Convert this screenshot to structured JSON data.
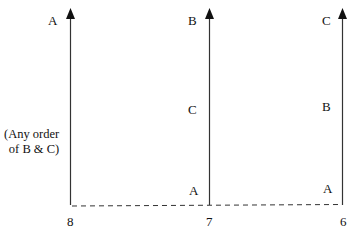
{
  "diagram": {
    "columns": [
      {
        "id": "col-8",
        "axis_label": "8",
        "labels": [
          {
            "text": "A",
            "position": "top"
          }
        ],
        "note": [
          "(Any order",
          "of B & C)"
        ]
      },
      {
        "id": "col-7",
        "axis_label": "7",
        "labels": [
          {
            "text": "B",
            "position": "top"
          },
          {
            "text": "C",
            "position": "middle"
          },
          {
            "text": "A",
            "position": "bottom"
          }
        ]
      },
      {
        "id": "col-6",
        "axis_label": "6",
        "labels": [
          {
            "text": "C",
            "position": "top"
          },
          {
            "text": "B",
            "position": "middle"
          },
          {
            "text": "A",
            "position": "bottom"
          }
        ]
      }
    ],
    "colors": {
      "line": "#222222",
      "text": "#111111"
    }
  }
}
